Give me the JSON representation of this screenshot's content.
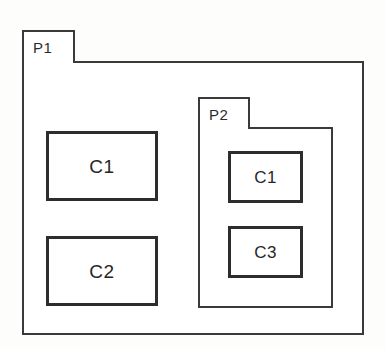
{
  "diagram": {
    "type": "uml-package-diagram",
    "background_color": "#fdfdfc",
    "line_color": "#3a3a3a",
    "text_color": "#262626",
    "packages": [
      {
        "id": "P1",
        "label": "P1",
        "tab_label": "P1",
        "classes": [
          {
            "id": "C1",
            "label": "C1"
          },
          {
            "id": "C2",
            "label": "C2"
          }
        ],
        "nested_packages": [
          {
            "id": "P2",
            "label": "P2",
            "tab_label": "P2",
            "classes": [
              {
                "id": "C1",
                "label": "C1"
              },
              {
                "id": "C3",
                "label": "C3"
              }
            ]
          }
        ]
      }
    ]
  }
}
